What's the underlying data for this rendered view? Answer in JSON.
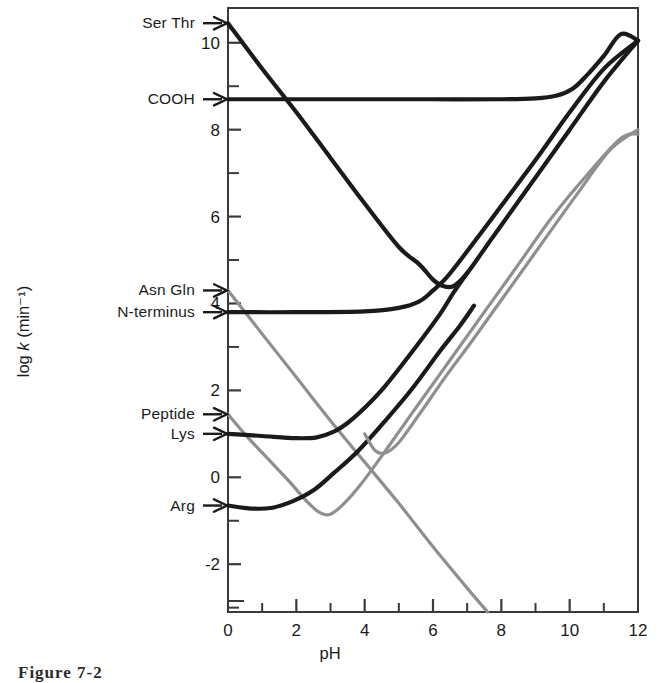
{
  "figure": {
    "caption": "Figure 7-2",
    "xaxis_title": "pH",
    "yaxis_title_prefix": "log ",
    "yaxis_title_italic": "k",
    "yaxis_title_suffix": " (min⁻¹)"
  },
  "colors": {
    "ink_black": "#1a1a1a",
    "ink_gray": "#8f8f8f",
    "axis": "#3a3a3a",
    "background": "#ffffff"
  },
  "chart_data": {
    "type": "line",
    "title": "",
    "xlabel": "pH",
    "ylabel": "log k (min⁻¹)",
    "xlim": [
      0,
      12
    ],
    "ylim": [
      -3.1,
      10.8
    ],
    "grid": false,
    "legend_position": "left-axis-arrows",
    "xticks": [
      0,
      2,
      4,
      6,
      8,
      10,
      12
    ],
    "xtick_labels": [
      "0",
      "2",
      "4",
      "6",
      "8",
      "10",
      "12"
    ],
    "x_minor_ticks": [
      1,
      3,
      5,
      7,
      9,
      11
    ],
    "yticks": [
      -2,
      0,
      2,
      4,
      6,
      8,
      10
    ],
    "ytick_labels": [
      "-2",
      "0",
      "2",
      "4",
      "6",
      "8",
      "10"
    ],
    "y_minor_ticks": [
      -3,
      -1,
      1,
      3,
      5,
      7,
      9
    ],
    "arrow_labels": [
      {
        "label": "Ser Thr",
        "value": 10.45,
        "color": "#1a1a1a"
      },
      {
        "label": "COOH",
        "value": 8.7,
        "color": "#1a1a1a"
      },
      {
        "label": "Asn Gln",
        "value": 4.3,
        "color": "#8f8f8f"
      },
      {
        "label": "N-terminus",
        "value": 3.8,
        "color": "#1a1a1a"
      },
      {
        "label": "Peptide",
        "value": 1.45,
        "color": "#8f8f8f"
      },
      {
        "label": "Lys",
        "value": 1.0,
        "color": "#1a1a1a"
      },
      {
        "label": "Arg",
        "value": -0.65,
        "color": "#1a1a1a"
      }
    ],
    "series": [
      {
        "name": "Ser Thr",
        "color": "#1a1a1a",
        "weight": "heavy",
        "y_intercept": 10.45,
        "minimum": {
          "x": 6.4,
          "y": 4.35
        },
        "points": [
          [
            0,
            10.45
          ],
          [
            1,
            9.4
          ],
          [
            2,
            8.4
          ],
          [
            3,
            7.35
          ],
          [
            4,
            6.3
          ],
          [
            5,
            5.3
          ],
          [
            5.6,
            4.9
          ],
          [
            6.0,
            4.55
          ],
          [
            6.3,
            4.4
          ],
          [
            6.6,
            4.4
          ],
          [
            7.0,
            4.7
          ],
          [
            7.5,
            5.25
          ],
          [
            8,
            5.8
          ],
          [
            9,
            6.9
          ],
          [
            10,
            8.0
          ],
          [
            11,
            9.1
          ],
          [
            12,
            10.05
          ]
        ]
      },
      {
        "name": "COOH",
        "color": "#1a1a1a",
        "weight": "heavy",
        "y_intercept": 8.7,
        "plateau": 8.7,
        "points": [
          [
            0,
            8.7
          ],
          [
            2,
            8.7
          ],
          [
            4,
            8.7
          ],
          [
            6,
            8.7
          ],
          [
            8,
            8.7
          ],
          [
            9,
            8.72
          ],
          [
            9.6,
            8.78
          ],
          [
            10.1,
            8.95
          ],
          [
            10.5,
            9.25
          ],
          [
            11,
            9.7
          ],
          [
            11.5,
            10.2
          ],
          [
            12,
            10.05
          ]
        ]
      },
      {
        "name": "Asn Gln",
        "color": "#8f8f8f",
        "weight": "light",
        "y_intercept": 4.3,
        "minimum": {
          "x": 7.1,
          "y": -3.1
        },
        "points": [
          [
            0,
            4.3
          ],
          [
            1,
            3.3
          ],
          [
            2,
            2.3
          ],
          [
            3,
            1.3
          ],
          [
            4,
            0.35
          ],
          [
            5,
            -0.6
          ],
          [
            6,
            -1.6
          ],
          [
            7,
            -2.55
          ],
          [
            7.6,
            -3.1
          ]
        ]
      },
      {
        "name": "N-terminus",
        "color": "#1a1a1a",
        "weight": "heavy",
        "y_intercept": 3.8,
        "minimum": {
          "x": 5.6,
          "y": 3.8
        },
        "points": [
          [
            0,
            3.8
          ],
          [
            2,
            3.8
          ],
          [
            4,
            3.82
          ],
          [
            5,
            3.9
          ],
          [
            5.6,
            4.05
          ],
          [
            6.0,
            4.3
          ],
          [
            6.4,
            4.6
          ],
          [
            7,
            5.2
          ],
          [
            8,
            6.25
          ],
          [
            9,
            7.3
          ],
          [
            10,
            8.4
          ],
          [
            11,
            9.4
          ],
          [
            12,
            10.05
          ]
        ]
      },
      {
        "name": "Peptide",
        "color": "#8f8f8f",
        "weight": "light",
        "y_intercept": 1.45,
        "minimum": {
          "x": 2.85,
          "y": -0.85
        },
        "points": [
          [
            0,
            1.45
          ],
          [
            0.6,
            0.9
          ],
          [
            1.2,
            0.4
          ],
          [
            1.8,
            -0.1
          ],
          [
            2.3,
            -0.55
          ],
          [
            2.7,
            -0.82
          ],
          [
            3.0,
            -0.85
          ],
          [
            3.4,
            -0.6
          ],
          [
            3.9,
            -0.15
          ],
          [
            4.6,
            0.6
          ],
          [
            5.5,
            1.6
          ],
          [
            6.5,
            2.7
          ],
          [
            7.5,
            3.8
          ],
          [
            8.5,
            4.9
          ],
          [
            9.5,
            6.0
          ],
          [
            10.5,
            6.95
          ],
          [
            11.5,
            7.8
          ],
          [
            12,
            7.9
          ]
        ]
      },
      {
        "name": "Lys",
        "color": "#1a1a1a",
        "weight": "heavy",
        "y_intercept": 1.0,
        "minimum": {
          "x": 2.4,
          "y": 0.88
        },
        "points": [
          [
            0,
            1.0
          ],
          [
            1,
            0.95
          ],
          [
            2,
            0.9
          ],
          [
            2.6,
            0.92
          ],
          [
            3.1,
            1.05
          ],
          [
            3.5,
            1.25
          ],
          [
            4,
            1.6
          ],
          [
            4.6,
            2.1
          ],
          [
            5.4,
            2.9
          ],
          [
            6.2,
            3.75
          ],
          [
            6.6,
            4.25
          ],
          [
            7,
            4.7
          ]
        ]
      },
      {
        "name": "Arg",
        "color": "#1a1a1a",
        "weight": "heavy",
        "y_intercept": -0.65,
        "minimum": {
          "x": 1.3,
          "y": -0.72
        },
        "points": [
          [
            0,
            -0.65
          ],
          [
            0.7,
            -0.72
          ],
          [
            1.3,
            -0.7
          ],
          [
            1.9,
            -0.55
          ],
          [
            2.5,
            -0.3
          ],
          [
            3.1,
            0.1
          ],
          [
            3.8,
            0.6
          ],
          [
            4.6,
            1.3
          ],
          [
            5.4,
            2.05
          ],
          [
            6.2,
            2.9
          ],
          [
            6.8,
            3.5
          ],
          [
            7.2,
            3.95
          ]
        ]
      },
      {
        "name": "Peptide-upper-branch",
        "color": "#8f8f8f",
        "weight": "light",
        "y_intercept": 4.3,
        "minimum": {
          "x": 4.45,
          "y": 0.55
        },
        "points": [
          [
            4.0,
            1.0
          ],
          [
            4.3,
            0.62
          ],
          [
            4.6,
            0.56
          ],
          [
            5.0,
            0.8
          ],
          [
            5.6,
            1.45
          ],
          [
            6.4,
            2.35
          ],
          [
            7.2,
            3.2
          ],
          [
            8.2,
            4.3
          ],
          [
            9.2,
            5.4
          ],
          [
            10.2,
            6.5
          ],
          [
            11.2,
            7.55
          ],
          [
            12,
            8.0
          ]
        ]
      }
    ]
  }
}
